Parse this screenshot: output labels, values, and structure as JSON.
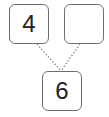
{
  "diagram": {
    "type": "number-bond",
    "parts": [
      {
        "label": "4"
      },
      {
        "label": ""
      }
    ],
    "whole": {
      "label": "6"
    },
    "colors": {
      "border": "#6e6e6e",
      "line": "#8a8a8a",
      "text": "#222222"
    }
  }
}
